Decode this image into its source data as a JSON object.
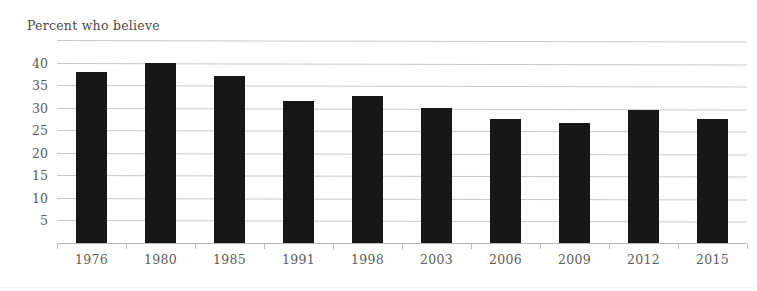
{
  "chart_data": {
    "type": "bar",
    "title": "Percent who believe",
    "xlabel": "",
    "ylabel": "",
    "categories": [
      "1976",
      "1980",
      "1985",
      "1991",
      "1998",
      "2003",
      "2006",
      "2009",
      "2012",
      "2015"
    ],
    "values": [
      38,
      40,
      37,
      31.5,
      32.5,
      30,
      27.5,
      26.5,
      29.5,
      27.5
    ],
    "ylim": [
      0,
      45
    ],
    "yticks": [
      5,
      10,
      15,
      20,
      25,
      30,
      35,
      40
    ],
    "ytick_labels": [
      "5",
      "10",
      "15",
      "20",
      "25",
      "30",
      "35",
      "40"
    ],
    "gridlines": [
      5,
      10,
      15,
      20,
      25,
      30,
      35,
      40,
      45
    ],
    "unlabeled_gridlines": [
      45
    ],
    "grid": true,
    "legend": null,
    "legend_position": "none",
    "bar_color": "#171717",
    "gridline_color": "#c9c9c9",
    "axis_color": "#b9b9b9",
    "text_color": "#5a5a5a",
    "background_color": "#ffffff",
    "annotations": []
  },
  "axis": {
    "y_title": "Percent who believe"
  }
}
